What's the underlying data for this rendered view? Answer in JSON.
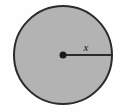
{
  "figure": {
    "name": "circle-with-radius-diagram",
    "background_color": "#fefefe",
    "canvas": {
      "width": 124,
      "height": 112
    },
    "circle": {
      "center_x": 63,
      "center_y": 55,
      "radius": 50,
      "fill_color": "#b3b3b3",
      "stroke_color": "#2b2b2b",
      "stroke_width": 2
    },
    "center_point": {
      "x": 63,
      "y": 55,
      "dot_radius": 3.5,
      "color": "#1a1a1a"
    },
    "radius_segment": {
      "x1": 63,
      "y1": 55,
      "x2": 113,
      "y2": 55,
      "color": "#2b2b2b",
      "stroke_width": 2
    },
    "radius_label": {
      "text": "x",
      "x": 87,
      "y": 50
    }
  }
}
